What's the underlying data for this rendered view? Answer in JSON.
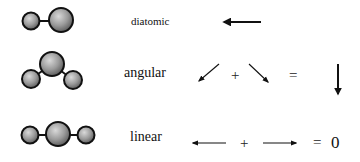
{
  "diagram": {
    "rows": [
      {
        "shape": "diatomic",
        "label": "diatomic",
        "vectors": [
          "left-arrow"
        ],
        "result": "net dipole pointing left"
      },
      {
        "shape": "angular",
        "label": "angular",
        "vectors": [
          "down-left-arrow",
          "down-right-arrow"
        ],
        "operator_plus": "+",
        "operator_equals": "=",
        "result": "down-arrow"
      },
      {
        "shape": "linear",
        "label": "linear",
        "vectors": [
          "left-arrow",
          "right-arrow"
        ],
        "operator_plus": "+",
        "operator_equals": "=",
        "result_value": "0"
      }
    ],
    "colors": {
      "sphere_outline": "#111111",
      "sphere_fill_light": "#c8c8c8",
      "sphere_fill_dark": "#6a6a6a",
      "arrow": "#111111",
      "background": "#ffffff"
    }
  }
}
